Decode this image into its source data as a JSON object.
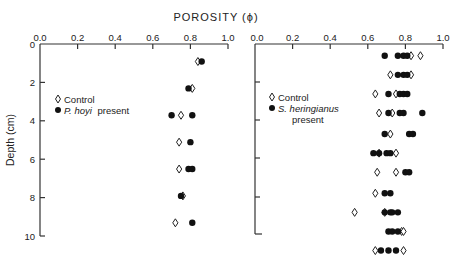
{
  "chart_data": [
    {
      "type": "scatter",
      "title": "POROSITY (ϕ)",
      "xlabel": "POROSITY (ϕ)",
      "ylabel": "Depth (cm)",
      "xlim": [
        0.0,
        1.0
      ],
      "ylim": [
        10,
        0
      ],
      "x_ticks": [
        "0.0",
        "0.2",
        "0.4",
        "0.6",
        "0.8",
        "1.0"
      ],
      "y_ticks": [
        "0",
        "2",
        "4",
        "6",
        "8",
        "10"
      ],
      "legend": [
        {
          "name": "Control",
          "marker": "open-diamond"
        },
        {
          "name": "P. hoyi present",
          "marker": "filled-circle"
        }
      ],
      "grid": false,
      "series": [
        {
          "name": "Control",
          "marker": "open-diamond",
          "points": [
            [
              0.84,
              0.6
            ],
            [
              0.81,
              2.0
            ],
            [
              0.75,
              3.4
            ],
            [
              0.74,
              4.8
            ],
            [
              0.74,
              6.2
            ],
            [
              0.76,
              7.6
            ],
            [
              0.72,
              9.0
            ]
          ]
        },
        {
          "name": "P. hoyi present",
          "marker": "filled-circle",
          "points": [
            [
              0.86,
              0.6
            ],
            [
              0.79,
              2.0
            ],
            [
              0.7,
              3.4
            ],
            [
              0.81,
              3.4
            ],
            [
              0.8,
              4.8
            ],
            [
              0.79,
              6.2
            ],
            [
              0.81,
              6.2
            ],
            [
              0.75,
              7.6
            ],
            [
              0.81,
              9.0
            ]
          ]
        }
      ]
    },
    {
      "type": "scatter",
      "title": "POROSITY (ϕ)",
      "xlabel": "POROSITY (ϕ)",
      "ylabel": "Depth (cm)",
      "xlim": [
        0.0,
        1.0
      ],
      "ylim": [
        10,
        0
      ],
      "x_ticks": [
        "0.0",
        "0.2",
        "0.4",
        "0.6",
        "0.8",
        "1.0"
      ],
      "y_ticks": [
        "0",
        "2",
        "4",
        "6",
        "8",
        "10"
      ],
      "legend": [
        {
          "name": "Control",
          "marker": "open-diamond"
        },
        {
          "name": "S. heringianus present",
          "marker": "filled-circle"
        }
      ],
      "grid": false,
      "series": [
        {
          "name": "Control",
          "marker": "open-diamond",
          "points": [
            [
              0.83,
              0.3
            ],
            [
              0.88,
              0.3
            ],
            [
              0.72,
              1.3
            ],
            [
              0.83,
              1.3
            ],
            [
              0.64,
              2.3
            ],
            [
              0.75,
              2.3
            ],
            [
              0.66,
              3.3
            ],
            [
              0.73,
              3.3
            ],
            [
              0.72,
              4.4
            ],
            [
              0.66,
              5.4
            ],
            [
              0.75,
              5.4
            ],
            [
              0.65,
              6.4
            ],
            [
              0.75,
              6.4
            ],
            [
              0.64,
              7.5
            ],
            [
              0.53,
              8.5
            ],
            [
              0.69,
              8.5
            ],
            [
              0.78,
              9.5
            ],
            [
              0.79,
              9.5
            ],
            [
              0.64,
              10.5
            ],
            [
              0.79,
              10.5
            ]
          ]
        },
        {
          "name": "S. heringianus present",
          "marker": "filled-circle",
          "points": [
            [
              0.69,
              0.3
            ],
            [
              0.76,
              0.3
            ],
            [
              0.79,
              0.3
            ],
            [
              0.81,
              0.3
            ],
            [
              0.76,
              1.3
            ],
            [
              0.79,
              1.3
            ],
            [
              0.81,
              1.3
            ],
            [
              0.71,
              2.3
            ],
            [
              0.77,
              2.3
            ],
            [
              0.79,
              2.3
            ],
            [
              0.81,
              2.3
            ],
            [
              0.71,
              3.3
            ],
            [
              0.77,
              3.3
            ],
            [
              0.79,
              3.3
            ],
            [
              0.89,
              3.3
            ],
            [
              0.69,
              4.4
            ],
            [
              0.82,
              4.4
            ],
            [
              0.84,
              4.4
            ],
            [
              0.63,
              5.4
            ],
            [
              0.66,
              5.4
            ],
            [
              0.7,
              5.4
            ],
            [
              0.72,
              5.4
            ],
            [
              0.8,
              6.4
            ],
            [
              0.82,
              6.4
            ],
            [
              0.69,
              7.5
            ],
            [
              0.72,
              7.5
            ],
            [
              0.69,
              8.5
            ],
            [
              0.72,
              8.5
            ],
            [
              0.73,
              8.5
            ],
            [
              0.76,
              8.5
            ],
            [
              0.71,
              9.5
            ],
            [
              0.73,
              9.5
            ],
            [
              0.76,
              9.5
            ],
            [
              0.67,
              10.5
            ],
            [
              0.71,
              10.5
            ],
            [
              0.75,
              10.5
            ]
          ]
        }
      ]
    }
  ],
  "figure": {
    "title": "POROSITY (ϕ)",
    "ylabel": "Depth (cm)",
    "left_panel": {
      "x_ticks": [
        "0.0",
        "0.2",
        "0.4",
        "0.6",
        "0.8",
        "1.0"
      ],
      "y_ticks": [
        "0",
        "2",
        "4",
        "6",
        "8",
        "10"
      ],
      "legend_control": "Control",
      "legend_present_species": "P. hoyi",
      "legend_present_suffix": "present"
    },
    "right_panel": {
      "x_ticks": [
        "0.0",
        "0.2",
        "0.4",
        "0.6",
        "0.8",
        "1.0"
      ],
      "legend_control": "Control",
      "legend_present_species": "S. heringianus",
      "legend_present_suffix": "present"
    }
  }
}
